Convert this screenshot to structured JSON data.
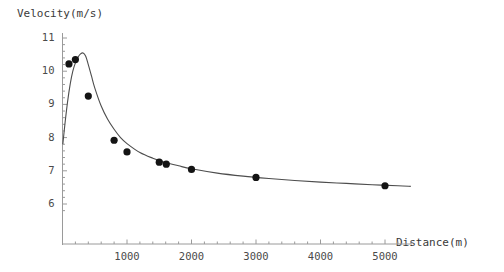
{
  "chart_data": {
    "type": "scatter",
    "title": "",
    "xlabel": "Distance(m)",
    "ylabel": "Velocity(m/s)",
    "xlim": [
      0,
      5450
    ],
    "ylim": [
      5.6,
      11.2
    ],
    "xticks": [
      1000,
      2000,
      3000,
      4000,
      5000
    ],
    "xtick_labels": [
      "1000",
      "2000",
      "3000",
      "4000",
      "5000"
    ],
    "yticks": [
      6,
      7,
      8,
      9,
      10,
      11
    ],
    "ytick_labels": [
      "6",
      "7",
      "8",
      "9",
      "10",
      "11"
    ],
    "grid": false,
    "legend": false,
    "points": {
      "name": "Observed world records",
      "x": [
        100,
        200,
        400,
        800,
        1000,
        1500,
        1609,
        2000,
        3000,
        5000
      ],
      "y": [
        10.22,
        10.35,
        9.25,
        7.92,
        7.57,
        7.26,
        7.2,
        7.04,
        6.8,
        6.55
      ]
    },
    "curve": {
      "name": "Fitted model",
      "x": [
        5,
        40,
        80,
        120,
        160,
        200,
        240,
        280,
        320,
        360,
        400,
        450,
        500,
        600,
        700,
        800,
        900,
        1000,
        1200,
        1400,
        1600,
        1800,
        2000,
        2400,
        2800,
        3200,
        3600,
        4000,
        4400,
        4800,
        5200,
        5400
      ],
      "y": [
        7.8,
        8.45,
        9.1,
        9.62,
        10.0,
        10.25,
        10.42,
        10.52,
        10.55,
        10.45,
        10.2,
        9.85,
        9.5,
        8.95,
        8.55,
        8.25,
        8.0,
        7.82,
        7.55,
        7.38,
        7.25,
        7.15,
        7.06,
        6.93,
        6.84,
        6.77,
        6.71,
        6.66,
        6.62,
        6.58,
        6.55,
        6.53
      ]
    }
  }
}
